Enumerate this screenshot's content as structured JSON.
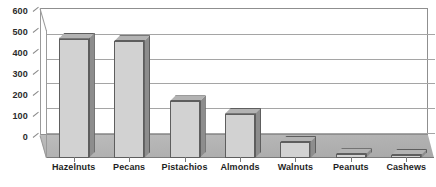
{
  "chart_data": {
    "type": "bar",
    "title": "",
    "subtitle": "",
    "xlabel": "",
    "ylabel": "",
    "categories": [
      "Hazelnuts",
      "Pecans",
      "Pistachios",
      "Almonds",
      "Walnuts",
      "Peanuts",
      "Cashews"
    ],
    "values": [
      485,
      475,
      230,
      180,
      65,
      15,
      12
    ],
    "series": [
      {
        "name": "",
        "values": [
          485,
          475,
          230,
          180,
          65,
          15,
          12
        ]
      }
    ],
    "ylim": [
      0,
      600
    ],
    "yticks": [
      0,
      100,
      200,
      300,
      400,
      500,
      600
    ],
    "ytick_labels": [
      "0",
      "100",
      "200",
      "300",
      "400",
      "500",
      "600"
    ],
    "grid": true,
    "grid_axis": "y",
    "legend": false,
    "legend_position": "none",
    "style": "3d-bar-grayscale",
    "colors": {
      "bar_front": "#d2d2d2",
      "bar_side": "#8d8d8d",
      "bar_top": "#b3b3b3",
      "bar_outline": "#5e5e5e",
      "gridline": "#a5a5a5",
      "axis": "#8f8f8f",
      "floor": "#b0b0b0",
      "background": "#ffffff",
      "text": "#1f1f1f"
    }
  }
}
